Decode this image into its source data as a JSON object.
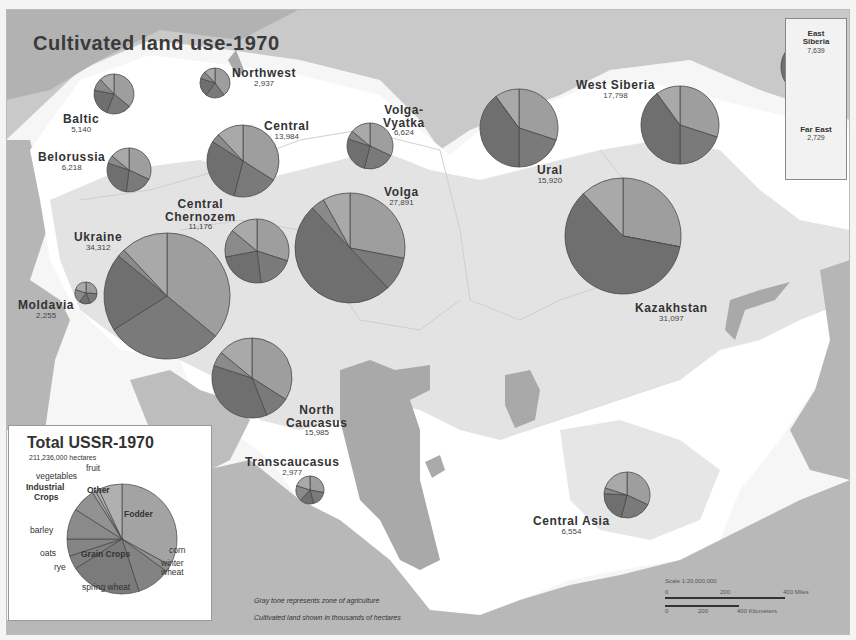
{
  "title": "Cultivated land use-1970",
  "colors": {
    "background": "#f4f4f4",
    "land_outside": "#b4b4b4",
    "water": "#a8a8a8",
    "agri_zone": "#d4d4d4",
    "non_agri": "#f8f8f8",
    "fodder": "#9e9e9e",
    "grain": "#7a7a7a",
    "other": "#a9a9a9",
    "industrial": "#8a8a8a",
    "pie_stroke": "#444444"
  },
  "regions": [
    {
      "name": "Northwest",
      "value": "2,937"
    },
    {
      "name": "Baltic",
      "value": "5,140"
    },
    {
      "name": "Belorussia",
      "value": "6,218"
    },
    {
      "name": "Central",
      "value": "13,984"
    },
    {
      "name": "Volga-Vyatka",
      "value": "6,624"
    },
    {
      "name": "Central Chernozem",
      "value": "11,176"
    },
    {
      "name": "Volga",
      "value": "27,891"
    },
    {
      "name": "Ukraine",
      "value": "34,312"
    },
    {
      "name": "Moldavia",
      "value": "2,255"
    },
    {
      "name": "North Caucasus",
      "value": "15,985"
    },
    {
      "name": "Transcaucasus",
      "value": "2,977"
    },
    {
      "name": "Ural",
      "value": "15,920"
    },
    {
      "name": "West Siberia",
      "value": "17,798"
    },
    {
      "name": "Kazakhstan",
      "value": "31,097"
    },
    {
      "name": "Central Asia",
      "value": "6,554"
    },
    {
      "name": "East Siberia",
      "value": "7,639"
    },
    {
      "name": "Far East",
      "value": "2,729"
    }
  ],
  "labels": {
    "northwest": {
      "name": "Northwest",
      "value": "2,937"
    },
    "baltic": {
      "name": "Baltic",
      "value": "5,140"
    },
    "belorussia": {
      "name": "Belorussia",
      "value": "6,218"
    },
    "central": {
      "name": "Central",
      "value": "13,984"
    },
    "volga_vyatka": {
      "name1": "Volga-",
      "name2": "Vyatka",
      "value": "6,624"
    },
    "chernozem": {
      "name1": "Central",
      "name2": "Chernozem",
      "value": "11,176"
    },
    "volga": {
      "name": "Volga",
      "value": "27,891"
    },
    "ukraine": {
      "name": "Ukraine",
      "value": "34,312"
    },
    "moldavia": {
      "name": "Moldavia",
      "value": "2,255"
    },
    "n_caucasus": {
      "name1": "North",
      "name2": "Caucasus",
      "value": "15,985"
    },
    "transcaucasus": {
      "name": "Transcaucasus",
      "value": "2,977"
    },
    "ural": {
      "name": "Ural",
      "value": "15,920"
    },
    "w_siberia": {
      "name": "West Siberia",
      "value": "17,798"
    },
    "kazakhstan": {
      "name": "Kazakhstan",
      "value": "31,097"
    },
    "c_asia": {
      "name": "Central Asia",
      "value": "6,554"
    },
    "e_siberia": {
      "name1": "East",
      "name2": "Siberia",
      "value": "7,639"
    },
    "far_east": {
      "name": "Far East",
      "value": "2,729"
    }
  },
  "legend": {
    "title": "Total USSR-1970",
    "subtitle": "211,236,000 hectares",
    "items": {
      "fruit": "fruit",
      "vegetables": "vegetables",
      "industrial": "Industrial",
      "industrial2": "Crops",
      "other": "Other",
      "fodder": "Fodder",
      "barley": "barley",
      "oats": "oats",
      "rye": "rye",
      "grain": "Grain  Crops",
      "corn": "corn",
      "winter": "winter",
      "winter2": "wheat",
      "spring": "spring wheat"
    }
  },
  "notes": {
    "gray_tone": "Gray tone represents zone of agriculture",
    "units": "Cultivated land shown in thousands of hectares"
  },
  "scale": {
    "title": "Scale 1:20,000,000",
    "miles": [
      "0",
      "200",
      "400 Miles"
    ],
    "km": [
      "0",
      "200",
      "400 Kilometers"
    ]
  },
  "chart_data": {
    "type": "pie",
    "title": "Total USSR-1970",
    "subtitle": "211,236,000 hectares",
    "categories": [
      "Fodder",
      "corn",
      "winter wheat",
      "spring wheat",
      "rye",
      "oats",
      "barley",
      "Industrial Crops",
      "vegetables",
      "fruit",
      "Other"
    ],
    "values": [
      33,
      2,
      10,
      21,
      4,
      5,
      9,
      7,
      1,
      1,
      7
    ],
    "groups": {
      "Grain Crops": [
        "corn",
        "winter wheat",
        "spring wheat",
        "rye",
        "oats",
        "barley"
      ],
      "Other": [
        "vegetables",
        "fruit",
        "Other"
      ]
    },
    "unit": "percent (approx.)",
    "regional_totals_thousand_ha": {
      "Northwest": 2937,
      "Baltic": 5140,
      "Belorussia": 6218,
      "Central": 13984,
      "Volga-Vyatka": 6624,
      "Central Chernozem": 11176,
      "Volga": 27891,
      "Ukraine": 34312,
      "Moldavia": 2255,
      "North Caucasus": 15985,
      "Transcaucasus": 2977,
      "Ural": 15920,
      "West Siberia": 17798,
      "Kazakhstan": 31097,
      "Central Asia": 6554,
      "East Siberia": 7639,
      "Far East": 2729
    }
  }
}
